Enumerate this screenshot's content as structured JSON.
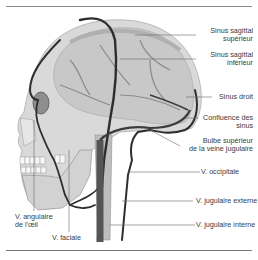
{
  "figure": {
    "colors": {
      "skull_fill": "#d9d9d9",
      "brain_fill": "#c8c8c8",
      "vein_dark": "#2e2e2e",
      "vein_mid": "#555555",
      "leader_line": "#6a6a6a",
      "label_text": "#3a3a3a",
      "rule": "#8a8a8a"
    }
  },
  "labels": {
    "sinus_sagittal_superieur": [
      "Sinus sagittal",
      "supérieur"
    ],
    "sinus_sagittal_inferieur": [
      "Sinus sagittal",
      "inférieur"
    ],
    "sinus_droit": "Sinus droit",
    "confluence_des_sinus": [
      "Confluence des",
      "sinus"
    ],
    "bulbe_superieur": [
      "Bulbe supérieur",
      "de la veine jugulaire"
    ],
    "v_occipitale": "V. occipitale",
    "v_jugulaire_externe": "V. jugulaire externe",
    "v_jugulaire_interne": "V. jugulaire interne",
    "v_angulaire": [
      "V. angulaire",
      "de l'œil"
    ],
    "v_faciale": "V. faciale"
  }
}
